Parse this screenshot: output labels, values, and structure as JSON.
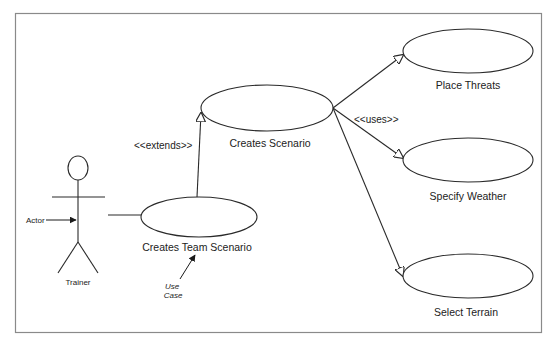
{
  "diagram": {
    "type": "UML use case diagram",
    "colors": {
      "line": "#2a2a2a",
      "border": "#8a8a8a",
      "background": "#ffffff",
      "text": "#222222"
    },
    "actor": {
      "name": "Trainer",
      "annotation": "Actor"
    },
    "use_cases": [
      {
        "id": "creates-team-scenario",
        "label": "Creates Team Scenario"
      },
      {
        "id": "creates-scenario",
        "label": "Creates Scenario"
      },
      {
        "id": "place-threats",
        "label": "Place Threats"
      },
      {
        "id": "specify-weather",
        "label": "Specify Weather"
      },
      {
        "id": "select-terrain",
        "label": "Select Terrain"
      }
    ],
    "relationships": [
      {
        "from": "Trainer",
        "to": "Creates Team Scenario",
        "type": "association"
      },
      {
        "from": "Creates Team Scenario",
        "to": "Creates Scenario",
        "type": "extends",
        "label": "<<extends>>"
      },
      {
        "from": "Creates Scenario",
        "to": "Place Threats",
        "type": "uses"
      },
      {
        "from": "Creates Scenario",
        "to": "Specify Weather",
        "type": "uses",
        "label": "<<uses>>"
      },
      {
        "from": "Creates Scenario",
        "to": "Select Terrain",
        "type": "uses"
      }
    ],
    "annotations": {
      "use_case_note_line1": "Use",
      "use_case_note_line2": "Case"
    }
  }
}
